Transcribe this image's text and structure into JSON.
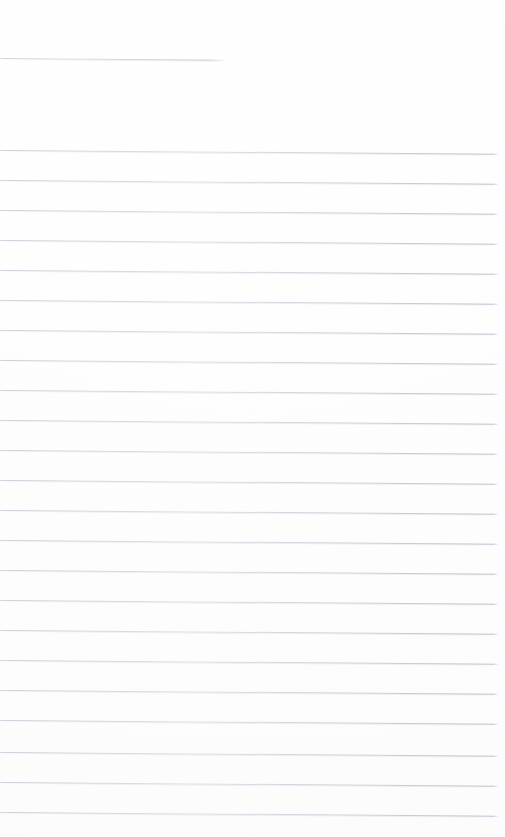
{
  "document": {
    "kind": "scanned-ruled-paper",
    "title": "Blank ruled notebook page",
    "page_width": 505,
    "page_height": 837,
    "background_color": "#ffffff",
    "rule_color": "#c4c9d2",
    "rule_thickness": 1,
    "content_text": "",
    "is_blank": true
  },
  "ruling": {
    "line_spacing": 29.7,
    "skew_degrees": 0.42,
    "left_margin": 0,
    "right_end": 498,
    "header_rule": {
      "y": 58,
      "x_start": 0,
      "x_end": 225,
      "length": 225
    },
    "body_first_rule_y": 150,
    "body_last_rule_y": 812,
    "body_rule_count": 23,
    "lines": [
      {
        "y": 58,
        "x_start": 0,
        "x_end": 225,
        "kind": "header"
      },
      {
        "y": 150,
        "x_start": 0,
        "x_end": 498,
        "kind": "body"
      },
      {
        "y": 180,
        "x_start": 0,
        "x_end": 498,
        "kind": "body"
      },
      {
        "y": 210,
        "x_start": 0,
        "x_end": 498,
        "kind": "body"
      },
      {
        "y": 240,
        "x_start": 0,
        "x_end": 498,
        "kind": "body"
      },
      {
        "y": 270,
        "x_start": 0,
        "x_end": 498,
        "kind": "body"
      },
      {
        "y": 300,
        "x_start": 0,
        "x_end": 498,
        "kind": "body"
      },
      {
        "y": 330,
        "x_start": 0,
        "x_end": 498,
        "kind": "body"
      },
      {
        "y": 360,
        "x_start": 0,
        "x_end": 498,
        "kind": "body"
      },
      {
        "y": 390,
        "x_start": 0,
        "x_end": 498,
        "kind": "body"
      },
      {
        "y": 420,
        "x_start": 0,
        "x_end": 498,
        "kind": "body"
      },
      {
        "y": 450,
        "x_start": 0,
        "x_end": 498,
        "kind": "body"
      },
      {
        "y": 480,
        "x_start": 0,
        "x_end": 498,
        "kind": "body"
      },
      {
        "y": 510,
        "x_start": 0,
        "x_end": 498,
        "kind": "body"
      },
      {
        "y": 540,
        "x_start": 0,
        "x_end": 498,
        "kind": "body"
      },
      {
        "y": 570,
        "x_start": 0,
        "x_end": 498,
        "kind": "body"
      },
      {
        "y": 600,
        "x_start": 0,
        "x_end": 498,
        "kind": "body"
      },
      {
        "y": 630,
        "x_start": 0,
        "x_end": 498,
        "kind": "body"
      },
      {
        "y": 660,
        "x_start": 0,
        "x_end": 498,
        "kind": "body"
      },
      {
        "y": 690,
        "x_start": 0,
        "x_end": 498,
        "kind": "body"
      },
      {
        "y": 720,
        "x_start": 0,
        "x_end": 498,
        "kind": "body"
      },
      {
        "y": 752,
        "x_start": 0,
        "x_end": 498,
        "kind": "body"
      },
      {
        "y": 782,
        "x_start": 0,
        "x_end": 498,
        "kind": "body"
      },
      {
        "y": 812,
        "x_start": 0,
        "x_end": 498,
        "kind": "body"
      }
    ]
  }
}
